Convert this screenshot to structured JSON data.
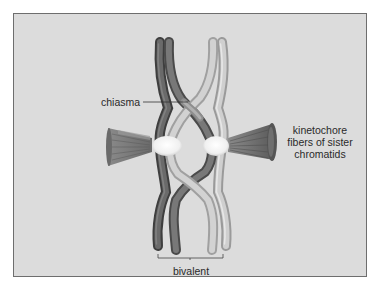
{
  "figure": {
    "type": "diagram",
    "labels": {
      "chiasma": "chiasma",
      "kinetochore_line1": "kinetochore",
      "kinetochore_line2": "fibers of sister",
      "kinetochore_line3": "chromatids",
      "bivalent": "bivalent"
    },
    "colors": {
      "background": "#dcdcdc",
      "frame_border": "#6e6e6e",
      "dark_chromatid": "#5e5e5e",
      "dark_chromatid_highlight": "#8a8a8a",
      "light_chromatid": "#b8b8b8",
      "light_chromatid_highlight": "#e4e4e4",
      "centromere": "#f8f8f8",
      "fiber": "#7a7a7a",
      "text": "#2a2a2a"
    }
  }
}
